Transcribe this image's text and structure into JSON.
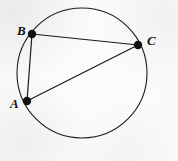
{
  "figure": {
    "background_color": "#fcfcfc",
    "stroke_color": "#1a1a1a",
    "canvas": {
      "width": 178,
      "height": 161
    }
  },
  "circle": {
    "name": "circumscribed-circle",
    "cx": 82,
    "cy": 73,
    "r": 65,
    "stroke_width": 1.1
  },
  "vertices": [
    {
      "id": "B",
      "label": "B",
      "x": 32,
      "y": 34,
      "dot_r": 4.2,
      "label_x": 17,
      "label_y": 24
    },
    {
      "id": "C",
      "label": "C",
      "x": 138,
      "y": 45,
      "dot_r": 4.2,
      "label_x": 147,
      "label_y": 34
    },
    {
      "id": "A",
      "label": "A",
      "x": 27,
      "y": 101,
      "dot_r": 4.2,
      "label_x": 10,
      "label_y": 97
    }
  ],
  "chords": [
    {
      "id": "BC",
      "from": "B",
      "to": "C",
      "x1": 32,
      "y1": 34,
      "x2": 138,
      "y2": 45,
      "stroke_width": 1.2
    },
    {
      "id": "BA",
      "from": "B",
      "to": "A",
      "x1": 32,
      "y1": 34,
      "x2": 27,
      "y2": 101,
      "stroke_width": 1.2
    },
    {
      "id": "AC",
      "from": "A",
      "to": "C",
      "x1": 27,
      "y1": 101,
      "x2": 138,
      "y2": 45,
      "stroke_width": 1.2
    }
  ],
  "chart_data": {
    "type": "diagram",
    "shape": "circle-with-inscribed-triangle",
    "points": [
      {
        "label": "A",
        "x": 27,
        "y": 101
      },
      {
        "label": "B",
        "x": 32,
        "y": 34
      },
      {
        "label": "C",
        "x": 138,
        "y": 45
      }
    ],
    "circle": {
      "cx": 82,
      "cy": 73,
      "r": 65
    },
    "segments": [
      "AB",
      "BC",
      "AC"
    ]
  }
}
